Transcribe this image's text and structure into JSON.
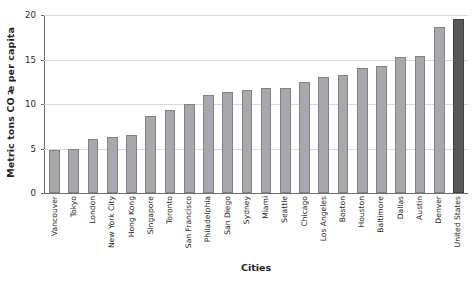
{
  "chart_data": {
    "type": "bar",
    "title": "",
    "xlabel": "Cities",
    "ylabel": "Metric tons CO2e per capita",
    "ylabel_parts": {
      "pre": "Metric tons CO",
      "sub": "2",
      "post": "e per capita"
    },
    "categories": [
      "Vancouver",
      "Tokyo",
      "London",
      "New York City",
      "Hong Kong",
      "Singapore",
      "Toronto",
      "San Francisco",
      "Philadelphia",
      "San Diego",
      "Sydney",
      "Miami",
      "Seattle",
      "Chicago",
      "Los Angeles",
      "Boston",
      "Houston",
      "Baltimore",
      "Dallas",
      "Austin",
      "Denver",
      "United States"
    ],
    "values": [
      4.8,
      5.0,
      6.1,
      6.3,
      6.5,
      8.6,
      9.3,
      10.0,
      11.0,
      11.3,
      11.6,
      11.8,
      11.8,
      12.5,
      13.0,
      13.3,
      14.0,
      14.3,
      15.3,
      15.4,
      18.7,
      19.6
    ],
    "highlight_index": 21,
    "ylim": [
      0,
      20
    ],
    "yticks": [
      0,
      5,
      10,
      15,
      20
    ],
    "ytick_labels": [
      "0",
      "5",
      "10",
      "15",
      "20"
    ],
    "grid": "horizontal",
    "legend": "none",
    "bar_color": "#a6a8ab",
    "highlight_color": "#58595b",
    "grid_color": "#d9d9d9",
    "axis_color": "#6d6e71"
  }
}
